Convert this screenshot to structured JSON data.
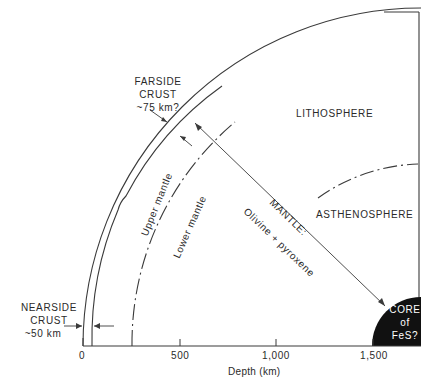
{
  "diagram": {
    "type": "quarter-section of lunar interior",
    "regions": {
      "lithosphere": "LITHOSPHERE",
      "asthenosphere": "ASTHENOSPHERE",
      "upper_mantle": "Upper mantle",
      "lower_mantle": "Lower mantle",
      "mantle_title": "MANTLE:",
      "mantle_composition": "Olivine + pyroxene",
      "core_line1": "CORE",
      "core_line2": "of",
      "core_line3": "FeS?"
    },
    "annotations": {
      "farside_line1": "FARSIDE",
      "farside_line2": "CRUST",
      "farside_line3": "~75 km?",
      "nearside_line1": "NEARSIDE",
      "nearside_line2": "CRUST",
      "nearside_line3": "~50 km"
    },
    "axis": {
      "label": "Depth (km)",
      "ticks": [
        "0",
        "500",
        "1,000",
        "1,500"
      ]
    },
    "colors": {
      "line": "#3a3a3a",
      "core_fill": "#111111",
      "background": "#ffffff"
    }
  }
}
